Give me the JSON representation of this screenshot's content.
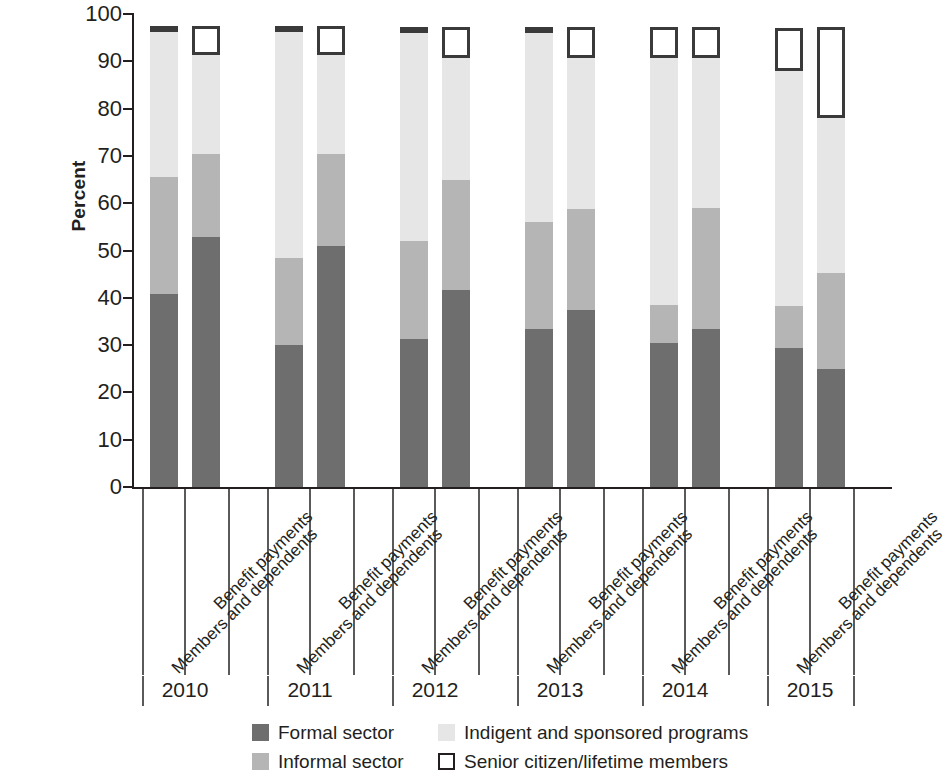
{
  "chart_data": {
    "type": "bar",
    "title": "",
    "subtitle": "",
    "xlabel": "",
    "ylabel": "Percent",
    "ylim": [
      0,
      100
    ],
    "yticks": [
      0,
      10,
      20,
      30,
      40,
      50,
      60,
      70,
      80,
      90,
      100
    ],
    "grid": false,
    "stacked": true,
    "legend_position": "bottom",
    "groups": [
      "2010",
      "2011",
      "2012",
      "2013",
      "2014",
      "2015"
    ],
    "categories": [
      "Members and dependents",
      "Benefit payments",
      "Members and dependents",
      "Benefit payments",
      "Members and dependents",
      "Benefit payments",
      "Members and dependents",
      "Benefit payments",
      "Members and dependents",
      "Benefit payments",
      "Members and dependents",
      "Benefit payments"
    ],
    "series": [
      {
        "name": "Formal sector",
        "color": "#6e6e6e",
        "values": [
          40.7,
          52.8,
          30.0,
          51.0,
          31.3,
          41.7,
          33.5,
          37.5,
          30.5,
          33.3,
          29.3,
          25.0
        ]
      },
      {
        "name": "Informal sector",
        "color": "#b5b5b5",
        "values": [
          24.8,
          17.5,
          18.5,
          19.5,
          20.7,
          23.3,
          22.5,
          21.3,
          8.0,
          25.7,
          9.0,
          20.3
        ]
      },
      {
        "name": "Indigent and sponsored programs",
        "color": "#e6e6e6",
        "values": [
          31.0,
          21.0,
          48.0,
          20.8,
          44.3,
          25.8,
          40.3,
          31.9,
          52.3,
          31.8,
          49.7,
          32.7
        ]
      },
      {
        "name": "Senior citizen/lifetime members",
        "color": "#ffffff",
        "values": [
          1.0,
          6.2,
          1.0,
          6.2,
          1.0,
          6.5,
          1.0,
          6.6,
          6.5,
          6.5,
          9.0,
          19.3
        ]
      }
    ],
    "stack_tops": [
      [
        40.7,
        65.5,
        96.5,
        97.5
      ],
      [
        52.8,
        70.3,
        91.3,
        97.5
      ],
      [
        30.0,
        48.5,
        96.5,
        97.5
      ],
      [
        51.0,
        70.5,
        91.3,
        97.5
      ],
      [
        31.3,
        52.0,
        96.3,
        97.3
      ],
      [
        41.7,
        65.0,
        90.8,
        97.3
      ],
      [
        33.5,
        56.0,
        96.3,
        97.3
      ],
      [
        37.5,
        58.8,
        90.7,
        97.3
      ],
      [
        30.5,
        38.5,
        90.8,
        97.3
      ],
      [
        33.3,
        59.0,
        90.8,
        97.3
      ],
      [
        29.3,
        38.3,
        88.0,
        97.0
      ],
      [
        25.0,
        45.3,
        78.0,
        97.3
      ]
    ]
  },
  "axis": {
    "y_title": "Percent",
    "y_tick_labels": [
      "100",
      "90",
      "80",
      "70",
      "60",
      "50",
      "40",
      "30",
      "20",
      "10",
      "0"
    ],
    "year_labels": [
      "2010",
      "2011",
      "2012",
      "2013",
      "2014",
      "2015"
    ],
    "category_labels": [
      "Members and dependents",
      "Benefit payments",
      "Members and dependents",
      "Benefit payments",
      "Members and dependents",
      "Benefit payments",
      "Members and dependents",
      "Benefit payments",
      "Members and dependents",
      "Benefit payments",
      "Members and dependents",
      "Benefit payments"
    ]
  },
  "legend": {
    "items": [
      {
        "label": "Formal sector",
        "swatch": "formal"
      },
      {
        "label": "Indigent and sponsored programs",
        "swatch": "indigent"
      },
      {
        "label": "Informal sector",
        "swatch": "informal"
      },
      {
        "label": "Senior citizen/lifetime members",
        "swatch": "senior"
      }
    ]
  }
}
